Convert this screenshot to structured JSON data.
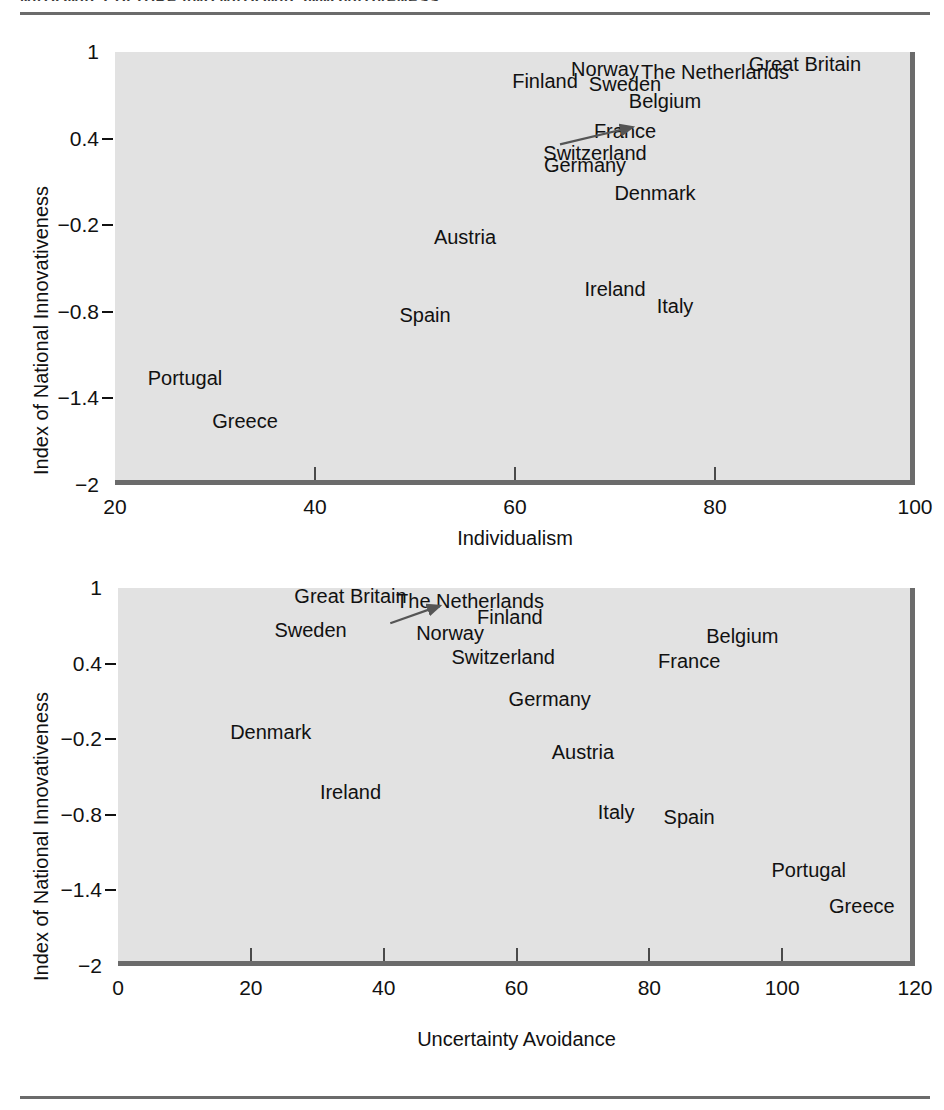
{
  "page": {
    "header_text_partial": "NATIONAL CULTURE AND NATIONAL INNOVATIVENESS",
    "rule_color": "#6b6b6b",
    "plot_background": "#e2e2e2",
    "text_color": "#111111",
    "arrow_color": "#555555"
  },
  "chart_data": [
    {
      "id": "chart-1",
      "type": "scatter",
      "title": "",
      "xlabel": "Individualism",
      "ylabel": "Index of National Innovativeness",
      "xlim": [
        20,
        100
      ],
      "ylim": [
        -2,
        1
      ],
      "xticks": [
        20,
        40,
        60,
        80,
        100
      ],
      "yticks": [
        1,
        0.4,
        -0.2,
        -0.8,
        -1.4,
        -2
      ],
      "xticklabels": [
        "20",
        "40",
        "60",
        "80",
        "100"
      ],
      "yticklabels": [
        "1",
        "0.4",
        "−0.2",
        "−0.8",
        "−1.4",
        "−2"
      ],
      "grid": false,
      "legend": "none",
      "label_mode": "country-name-as-marker",
      "points": [
        {
          "label": "Great Britain",
          "x": 89.0,
          "y": 0.92
        },
        {
          "label": "Norway",
          "x": 69.0,
          "y": 0.88
        },
        {
          "label": "The Netherlands",
          "x": 80.0,
          "y": 0.86
        },
        {
          "label": "Finland",
          "x": 63.0,
          "y": 0.8
        },
        {
          "label": "Sweden",
          "x": 71.0,
          "y": 0.78
        },
        {
          "label": "Belgium",
          "x": 75.0,
          "y": 0.66
        },
        {
          "label": "France",
          "x": 71.0,
          "y": 0.45
        },
        {
          "label": "Switzerland",
          "x": 68.0,
          "y": 0.3
        },
        {
          "label": "Germany",
          "x": 67.0,
          "y": 0.22
        },
        {
          "label": "Denmark",
          "x": 74.0,
          "y": 0.02
        },
        {
          "label": "Austria",
          "x": 55.0,
          "y": -0.28
        },
        {
          "label": "Ireland",
          "x": 70.0,
          "y": -0.64
        },
        {
          "label": "Italy",
          "x": 76.0,
          "y": -0.76
        },
        {
          "label": "Spain",
          "x": 51.0,
          "y": -0.82
        },
        {
          "label": "Portugal",
          "x": 27.0,
          "y": -1.26
        },
        {
          "label": "Greece",
          "x": 33.0,
          "y": -1.56
        }
      ],
      "annotations": [
        {
          "type": "arrow",
          "from_label": "Switzerland",
          "to_label": "France",
          "from": {
            "x": 64.5,
            "y": 0.36
          },
          "to": {
            "x": 71.8,
            "y": 0.48
          }
        }
      ]
    },
    {
      "id": "chart-2",
      "type": "scatter",
      "title": "",
      "xlabel": "Uncertainty Avoidance",
      "ylabel": "Index of National Innovativeness",
      "xlim": [
        0,
        120
      ],
      "ylim": [
        -2,
        1
      ],
      "xticks": [
        0,
        20,
        40,
        60,
        80,
        100,
        120
      ],
      "yticks": [
        1,
        0.4,
        -0.2,
        -0.8,
        -1.4,
        -2
      ],
      "xticklabels": [
        "0",
        "20",
        "40",
        "60",
        "80",
        "100",
        "120"
      ],
      "yticklabels": [
        "1",
        "0.4",
        "−0.2",
        "−0.8",
        "−1.4",
        "−2"
      ],
      "grid": false,
      "legend": "none",
      "label_mode": "country-name-as-marker",
      "points": [
        {
          "label": "Great Britain",
          "x": 35.0,
          "y": 0.94
        },
        {
          "label": "The Netherlands",
          "x": 53.0,
          "y": 0.9
        },
        {
          "label": "Finland",
          "x": 59.0,
          "y": 0.77
        },
        {
          "label": "Sweden",
          "x": 29.0,
          "y": 0.67
        },
        {
          "label": "Norway",
          "x": 50.0,
          "y": 0.64
        },
        {
          "label": "Belgium",
          "x": 94.0,
          "y": 0.62
        },
        {
          "label": "Switzerland",
          "x": 58.0,
          "y": 0.45
        },
        {
          "label": "France",
          "x": 86.0,
          "y": 0.42
        },
        {
          "label": "Germany",
          "x": 65.0,
          "y": 0.12
        },
        {
          "label": "Denmark",
          "x": 23.0,
          "y": -0.14
        },
        {
          "label": "Austria",
          "x": 70.0,
          "y": -0.3
        },
        {
          "label": "Ireland",
          "x": 35.0,
          "y": -0.62
        },
        {
          "label": "Italy",
          "x": 75.0,
          "y": -0.78
        },
        {
          "label": "Spain",
          "x": 86.0,
          "y": -0.82
        },
        {
          "label": "Portugal",
          "x": 104.0,
          "y": -1.24
        },
        {
          "label": "Greece",
          "x": 112.0,
          "y": -1.52
        }
      ],
      "annotations": [
        {
          "type": "arrow",
          "from_label": "Norway",
          "to_label": "Great Britain",
          "from": {
            "x": 41.0,
            "y": 0.72
          },
          "to": {
            "x": 48.5,
            "y": 0.86
          }
        }
      ]
    }
  ]
}
